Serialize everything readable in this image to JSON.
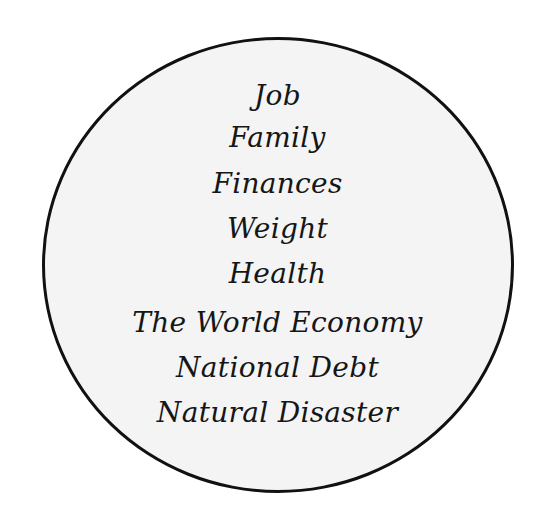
{
  "diagram": {
    "shape": "circle",
    "fill_color": "#f4f4f4",
    "stroke_color": "#111111",
    "background_color": "#ffffff",
    "items": [
      {
        "label": "Job"
      },
      {
        "label": "Family"
      },
      {
        "label": "Finances"
      },
      {
        "label": "Weight"
      },
      {
        "label": "Health"
      },
      {
        "label": "The World Economy"
      },
      {
        "label": "National Debt"
      },
      {
        "label": "Natural Disaster"
      }
    ]
  }
}
